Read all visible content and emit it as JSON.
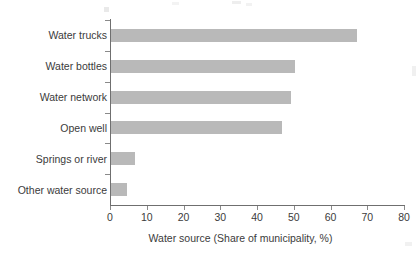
{
  "chart_data": {
    "type": "bar",
    "orientation": "horizontal",
    "title": "",
    "subtitle": "",
    "categories": [
      "Water trucks",
      "Water bottles",
      "Water network",
      "Open well",
      "Springs or river",
      "Other water source"
    ],
    "values": [
      67,
      50,
      49,
      46.5,
      6.5,
      4.3
    ],
    "series": [
      {
        "name": "Share of municipality",
        "values": [
          67,
          50,
          49,
          46.5,
          6.5,
          4.3
        ]
      }
    ],
    "xlabel": "Water source (Share of municipality, %)",
    "ylabel": "",
    "xlim": [
      0,
      80
    ],
    "xticks": [
      0,
      10,
      20,
      30,
      40,
      50,
      60,
      70,
      80
    ],
    "xtick_labels": [
      "0",
      "10",
      "20",
      "30",
      "40",
      "50",
      "60",
      "70",
      "80"
    ],
    "grid": false,
    "legend": false,
    "legend_position": "none",
    "bar_color": "#b9b9b9",
    "axis_color": "#6f6f6f",
    "text_color": "#3b3b3b",
    "background_color": "#ffffff"
  },
  "axes": {
    "x_title": "Water source (Share of municipality, %)"
  }
}
